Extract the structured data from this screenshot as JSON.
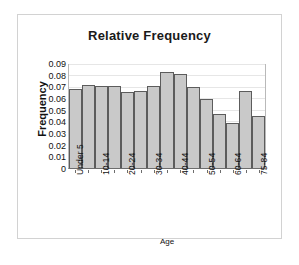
{
  "chart_data": {
    "type": "bar",
    "title": "Relative Frequency",
    "xlabel": "Age",
    "ylabel": "Frequency",
    "categories": [
      "Under 5",
      "5-9",
      "10-14",
      "15-19",
      "20-24",
      "25-29",
      "30-34",
      "35-39",
      "40-44",
      "45-49",
      "50-54",
      "55-59",
      "60-64",
      "65-74",
      "75-84"
    ],
    "tick_labels": [
      "Under 5",
      "",
      "10-14",
      "",
      "20-24",
      "",
      "30-34",
      "",
      "40-44",
      "",
      "50-54",
      "",
      "60-64",
      "",
      "75-84"
    ],
    "values": [
      0.069,
      0.0725,
      0.0715,
      0.0715,
      0.0665,
      0.0675,
      0.0715,
      0.0835,
      0.082,
      0.071,
      0.06,
      0.0475,
      0.0395,
      0.0675,
      0.0455
    ],
    "values_note": "last bar 0.015",
    "ylim": [
      0,
      0.09
    ],
    "ytick_labels": [
      "0.09",
      "0.08",
      "0.07",
      "0.06",
      "0.05",
      "0.04",
      "0.03",
      "0.02",
      "0.01",
      "0"
    ],
    "ytick_values": [
      0.09,
      0.08,
      0.07,
      0.06,
      0.05,
      0.04,
      0.03,
      0.02,
      0.01,
      0
    ],
    "grid": true,
    "legend": false,
    "bar_fill": "#c9c9c9",
    "bar_stroke": "#5c5c5c"
  }
}
